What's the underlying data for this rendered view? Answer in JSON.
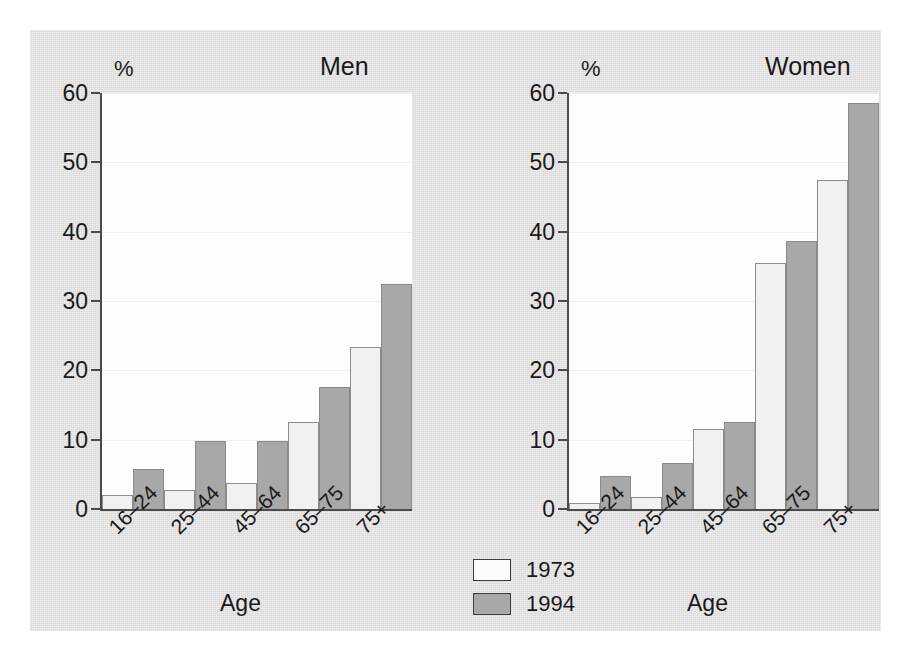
{
  "chart_data": {
    "type": "bar",
    "title": "",
    "panels": [
      {
        "title": "Men",
        "categories": [
          "16–24",
          "25–44",
          "45–64",
          "65–75",
          "75+"
        ],
        "series": [
          {
            "name": "1973",
            "values": [
              2,
              2.8,
              3.8,
              12.6,
              23.4
            ]
          },
          {
            "name": "1994",
            "values": [
              5.8,
              9.8,
              9.8,
              17.6,
              32.5
            ]
          }
        ],
        "xlabel": "Age",
        "ylabel": "%",
        "ylim": [
          0,
          60
        ]
      },
      {
        "title": "Women",
        "categories": [
          "16–24",
          "25–44",
          "45–64",
          "65–75",
          "75+"
        ],
        "series": [
          {
            "name": "1973",
            "values": [
              0.9,
              1.7,
              11.5,
              35.5,
              47.5
            ]
          },
          {
            "name": "1994",
            "values": [
              4.8,
              6.7,
              12.5,
              38.7,
              58.5
            ]
          }
        ],
        "xlabel": "Age",
        "ylabel": "%",
        "ylim": [
          0,
          60
        ]
      }
    ],
    "yticks": [
      0,
      10,
      20,
      30,
      40,
      50,
      60
    ],
    "grid": true,
    "legend": {
      "position": "bottom-center",
      "entries": [
        {
          "label": "1973",
          "color": "#f1f1f1"
        },
        {
          "label": "1994",
          "color": "#a8a8a8"
        }
      ]
    },
    "colors": {
      "background": "#e2e2e2",
      "plot_background": "#fdfdfd",
      "axis": "#4a4a4a",
      "series_1973": "#f1f1f1",
      "series_1994": "#a8a8a8"
    }
  }
}
